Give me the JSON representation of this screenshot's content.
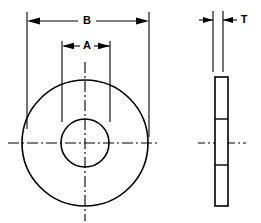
{
  "drawing": {
    "type": "engineering-dimension-drawing",
    "subject": "flat washer",
    "background_color": "#ffffff",
    "line_color": "#000000",
    "views": [
      {
        "id": "front-view",
        "name": "front view",
        "description": "two concentric circles with horizontal and vertical centerlines",
        "center": {
          "x": 85,
          "y": 143
        },
        "outer_circle_radius": 63,
        "inner_circle_radius": 24
      },
      {
        "id": "side-view",
        "name": "side view",
        "description": "thin tall rectangle in section with hole edge lines and horizontal centerline",
        "rect": {
          "x": 215,
          "y": 77,
          "width": 13,
          "height": 129
        },
        "hole_line_offsets": [
          42,
          88
        ]
      }
    ],
    "dimensions": [
      {
        "id": "dimension-b",
        "label": "B",
        "description": "outside diameter of washer",
        "label_position": {
          "x": 87,
          "y": 21
        },
        "dim_line_y": 21,
        "left_extension_x": 27,
        "right_extension_x": 149,
        "arrow_direction": "outward"
      },
      {
        "id": "dimension-a",
        "label": "A",
        "description": "inside hole diameter of washer",
        "label_position": {
          "x": 87,
          "y": 46
        },
        "dim_line_y": 46,
        "left_extension_x": 62,
        "right_extension_x": 110,
        "arrow_direction": "inward"
      },
      {
        "id": "dimension-t",
        "label": "T",
        "description": "thickness of washer",
        "label_position": {
          "x": 244,
          "y": 20
        },
        "dim_line_y": 20,
        "left_extension_x": 213,
        "right_extension_x": 223,
        "arrow_direction": "outward"
      }
    ]
  }
}
